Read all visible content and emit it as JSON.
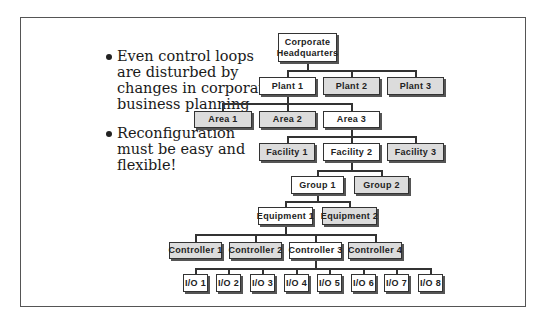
{
  "bullets": [
    {
      "text": "Even control loops are disturbed by changes in corporate business planning"
    },
    {
      "text": "Reconfiguration must be easy and flexible!"
    }
  ],
  "hierarchy": {
    "hq": {
      "label": "Corporate Headquarters",
      "shaded": false
    },
    "plants": [
      {
        "label": "Plant 1",
        "shaded": false
      },
      {
        "label": "Plant 2",
        "shaded": true
      },
      {
        "label": "Plant 3",
        "shaded": true
      }
    ],
    "areas": [
      {
        "label": "Area 1",
        "shaded": true
      },
      {
        "label": "Area 2",
        "shaded": true
      },
      {
        "label": "Area 3",
        "shaded": false
      }
    ],
    "facilities": [
      {
        "label": "Facility 1",
        "shaded": true
      },
      {
        "label": "Facility 2",
        "shaded": false
      },
      {
        "label": "Facility 3",
        "shaded": true
      }
    ],
    "groups": [
      {
        "label": "Group 1",
        "shaded": false
      },
      {
        "label": "Group 2",
        "shaded": true
      }
    ],
    "equipment": [
      {
        "label": "Equipment 1",
        "shaded": false
      },
      {
        "label": "Equipment 2",
        "shaded": true
      }
    ],
    "controllers": [
      {
        "label": "Controller 1",
        "shaded": true
      },
      {
        "label": "Controller 2",
        "shaded": true
      },
      {
        "label": "Controller 3",
        "shaded": false
      },
      {
        "label": "Controller 4",
        "shaded": true
      }
    ],
    "io": [
      {
        "label": "I/O 1"
      },
      {
        "label": "I/O 2"
      },
      {
        "label": "I/O 3"
      },
      {
        "label": "I/O 4"
      },
      {
        "label": "I/O 5"
      },
      {
        "label": "I/O 6"
      },
      {
        "label": "I/O 7"
      },
      {
        "label": "I/O 8"
      }
    ]
  },
  "colors": {
    "shaded_fill": "#dcdcdc",
    "plain_fill": "#ffffff",
    "border": "#333333"
  }
}
